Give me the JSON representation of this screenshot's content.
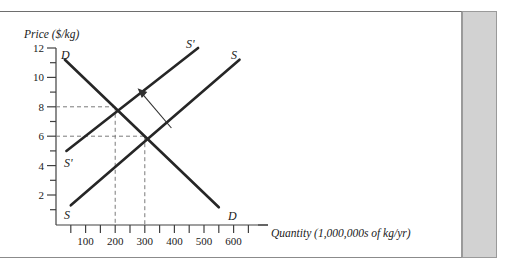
{
  "figure": {
    "y_axis_title": "Price ($/kg)",
    "x_axis_title": "Quantity (1,000,000s of kg/yr)",
    "curve_labels": {
      "demand_top": "D",
      "demand_bottom": "D",
      "supply_top": "S",
      "supply_bottom": "S",
      "supply_shift_top": "S'",
      "supply_shift_bottom": "S'"
    }
  },
  "chart_data": {
    "type": "line",
    "title": "",
    "xlabel": "Quantity (1,000,000s of kg/yr)",
    "ylabel": "Price ($/kg)",
    "xlim": [
      0,
      700
    ],
    "ylim": [
      0,
      12
    ],
    "grid": false,
    "legend": "inline-curve-labels",
    "y_ticks_major": [
      2,
      4,
      6,
      8,
      10,
      12
    ],
    "y_ticks_minor": [
      1,
      3,
      5,
      7,
      9,
      11
    ],
    "x_ticks_major": [
      100,
      200,
      300,
      400,
      500,
      600
    ],
    "x_ticks_minor": [
      50,
      150,
      250,
      350,
      450,
      550,
      650
    ],
    "x_tick_labels": [
      "100",
      "200",
      "300",
      "400",
      "500",
      "600"
    ],
    "y_tick_labels": [
      "2",
      "4",
      "6",
      "8",
      "10",
      "12"
    ],
    "series": [
      {
        "name": "D",
        "label": "Demand",
        "points": [
          [
            30,
            11.3
          ],
          [
            550,
            1.2
          ]
        ]
      },
      {
        "name": "S",
        "label": "Supply (original)",
        "points": [
          [
            50,
            1.3
          ],
          [
            620,
            11.3
          ]
        ]
      },
      {
        "name": "S'",
        "label": "Supply (shifted)",
        "points": [
          [
            35,
            5.0
          ],
          [
            480,
            12.0
          ]
        ]
      }
    ],
    "equilibria": [
      {
        "label": "new equilibrium",
        "quantity": 200,
        "price": 8,
        "curves": [
          "S'",
          "D"
        ],
        "guides": "dashed"
      },
      {
        "label": "original equilibrium",
        "quantity": 300,
        "price": 6,
        "curves": [
          "S",
          "D"
        ],
        "guides": "dashed"
      }
    ],
    "annotations": [
      {
        "type": "arrow",
        "meaning": "supply shift left",
        "from": [
          390,
          6.6
        ],
        "to": [
          290,
          9.0
        ]
      }
    ],
    "colors": {
      "curve": "#262626",
      "axis": "#404040",
      "guide": "#7a7a7a",
      "arrow": "#303030",
      "page_band": "#d2d2d2"
    }
  }
}
